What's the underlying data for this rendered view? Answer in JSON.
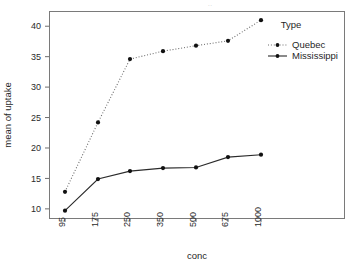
{
  "chart_data": {
    "type": "line",
    "title": "",
    "clipped_top_text": "..",
    "xlabel": "conc",
    "ylabel": "mean of uptake",
    "categories": [
      "95",
      "175",
      "250",
      "350",
      "500",
      "675",
      "1000"
    ],
    "x_tick_rotation_deg": 90,
    "ylim": [
      8.5,
      42.5
    ],
    "y_ticks": [
      "10",
      "15",
      "20",
      "25",
      "30",
      "35",
      "40"
    ],
    "y_tick_values": [
      10,
      15,
      20,
      25,
      30,
      35,
      40
    ],
    "grid": false,
    "legend": {
      "title": "Type",
      "position": "right-inside",
      "entries": [
        {
          "label": "Quebec",
          "line_style": "dotted",
          "marker": "filled-circle",
          "color": "#6d6d6d"
        },
        {
          "label": "Mississippi",
          "line_style": "solid",
          "marker": "filled-circle",
          "color": "#2b2b2b"
        }
      ]
    },
    "series": [
      {
        "name": "Quebec",
        "line_style": "dotted",
        "color": "#6d6d6d",
        "values": [
          12.8,
          24.2,
          34.6,
          35.9,
          36.8,
          37.6,
          41.0
        ]
      },
      {
        "name": "Mississippi",
        "line_style": "solid",
        "color": "#2b2b2b",
        "values": [
          9.7,
          14.9,
          16.2,
          16.7,
          16.8,
          18.5,
          18.9
        ]
      }
    ],
    "annotations": []
  },
  "plot_geometry": {
    "frame_left": 49,
    "frame_right": 344,
    "frame_top": 11,
    "frame_bottom": 218,
    "category_x": [
      65,
      98,
      130,
      163,
      196,
      228,
      261
    ]
  }
}
